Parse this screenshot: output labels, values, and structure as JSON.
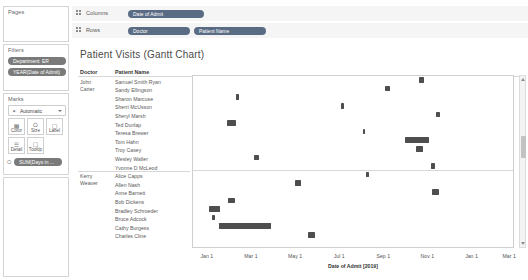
{
  "left_panel": {
    "pages": {
      "title": "Pages"
    },
    "filters": {
      "title": "Filters",
      "pills": [
        {
          "label": "Department: ER"
        },
        {
          "label": "YEAR(Date of Admit)"
        }
      ]
    },
    "marks": {
      "title": "Marks",
      "mark_type": "Automatic",
      "mark_type_icon": "automatic-mark-icon",
      "buttons": [
        {
          "label": "Color",
          "icon": "color-icon"
        },
        {
          "label": "Size",
          "icon": "size-icon"
        },
        {
          "label": "Label",
          "icon": "label-icon"
        },
        {
          "label": "Detail",
          "icon": "detail-icon"
        },
        {
          "label": "Tooltip",
          "icon": "tooltip-icon"
        }
      ],
      "encoding_pill": {
        "label": "SUM(Days in ...",
        "icon": "size-encoding-icon"
      }
    }
  },
  "shelves": {
    "columns": {
      "label": "Columns",
      "pills": [
        {
          "label": "Date of Admit"
        }
      ]
    },
    "rows": {
      "label": "Rows",
      "pills": [
        {
          "label": "Doctor"
        },
        {
          "label": "Patient Name"
        }
      ]
    }
  },
  "viz": {
    "title": "Patient Visits (Gantt Chart)",
    "header_doctor": "Doctor",
    "header_patient": "Patient Name"
  },
  "chart_data": {
    "type": "bar",
    "orientation": "horizontal-gantt",
    "title": "Patient Visits (Gantt Chart)",
    "xlabel": "Date of Admit [2019]",
    "ylabel": "",
    "grid": false,
    "legend": "none",
    "bar_color": "#4e4e4e",
    "x_ticks": [
      "Jan 1",
      "Mar 1",
      "May 1",
      "Jul 1",
      "Sep 1",
      "Nov 1",
      "Jan 1",
      "Mar 1"
    ],
    "x_tick_positions_pct": [
      4.6,
      18.3,
      32.0,
      45.7,
      59.4,
      73.1,
      86.8,
      98.5
    ],
    "groups": [
      {
        "doctor": "John Carter",
        "rows": [
          {
            "patient": "Samuel Smith Ryan",
            "start_pct": 70.5,
            "width_pct": 1.6
          },
          {
            "patient": "Sandy Ellingson",
            "start_pct": 60.0,
            "width_pct": 1.5
          },
          {
            "patient": "Sharon Marcuse",
            "start_pct": 13.5,
            "width_pct": 0.9
          },
          {
            "patient": "Sherri McUsson",
            "start_pct": 46.4,
            "width_pct": 0.9
          },
          {
            "patient": "Sheryl Marsh",
            "start_pct": 76.0,
            "width_pct": 1.2
          },
          {
            "patient": "Ted Dunlap",
            "start_pct": 10.6,
            "width_pct": 2.7
          },
          {
            "patient": "Teresa Brewer",
            "start_pct": 53.0,
            "width_pct": 0.9
          },
          {
            "patient": "Tom Hahn",
            "start_pct": 66.2,
            "width_pct": 7.6
          },
          {
            "patient": "Troy Casey",
            "start_pct": 69.6,
            "width_pct": 2.2
          },
          {
            "patient": "Wesley Waller",
            "start_pct": 19.0,
            "width_pct": 1.5
          },
          {
            "patient": "Yvonne D McLeod",
            "start_pct": 74.4,
            "width_pct": 1.3
          }
        ]
      },
      {
        "doctor": "Kerry Weaver",
        "rows": [
          {
            "patient": "Alice Capps",
            "start_pct": 54.0,
            "width_pct": 0.9
          },
          {
            "patient": "Allen Nash",
            "start_pct": 31.8,
            "width_pct": 1.8
          },
          {
            "patient": "Anne Barnett",
            "start_pct": 74.8,
            "width_pct": 2.2
          },
          {
            "patient": "Bob Dickens",
            "start_pct": 10.8,
            "width_pct": 2.2
          },
          {
            "patient": "Bradley Schroeder",
            "start_pct": 5.0,
            "width_pct": 3.3
          },
          {
            "patient": "Bruce Adcock",
            "start_pct": 6.0,
            "width_pct": 1.0
          },
          {
            "patient": "Cathy Burgess",
            "start_pct": 8.0,
            "width_pct": 16.5
          },
          {
            "patient": "Charles Cline",
            "start_pct": 36.0,
            "width_pct": 2.0
          }
        ]
      }
    ]
  }
}
